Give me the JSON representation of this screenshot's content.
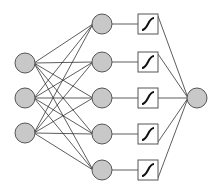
{
  "diagram": {
    "title": "",
    "colors": {
      "node_fill": "#c8c8c8",
      "node_stroke": "#555555",
      "edge": "#333333",
      "box_fill": "#ffffff",
      "box_stroke": "#555555",
      "curve": "#111111"
    },
    "input_nodes": [
      {
        "id": "in1",
        "cx": 25,
        "cy": 63
      },
      {
        "id": "in2",
        "cx": 25,
        "cy": 98
      },
      {
        "id": "in3",
        "cx": 25,
        "cy": 133
      }
    ],
    "hidden_nodes": [
      {
        "id": "h1",
        "cx": 102,
        "cy": 24
      },
      {
        "id": "h2",
        "cx": 102,
        "cy": 62
      },
      {
        "id": "h3",
        "cx": 102,
        "cy": 98
      },
      {
        "id": "h4",
        "cx": 102,
        "cy": 134
      },
      {
        "id": "h5",
        "cx": 102,
        "cy": 170
      }
    ],
    "activation_boxes": [
      {
        "id": "act1",
        "x": 138,
        "y": 14,
        "icon": "sigmoid-icon"
      },
      {
        "id": "act2",
        "x": 138,
        "y": 52,
        "icon": "sigmoid-icon"
      },
      {
        "id": "act3",
        "x": 138,
        "y": 88,
        "icon": "sigmoid-icon"
      },
      {
        "id": "act4",
        "x": 138,
        "y": 124,
        "icon": "sigmoid-icon"
      },
      {
        "id": "act5",
        "x": 138,
        "y": 160,
        "icon": "sigmoid-icon"
      }
    ],
    "output_node": {
      "id": "out",
      "cx": 197,
      "cy": 98
    },
    "node_radius": 10,
    "box_size": 20
  }
}
